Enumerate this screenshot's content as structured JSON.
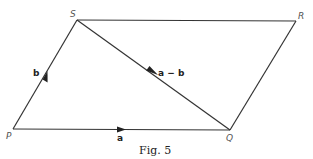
{
  "figure": {
    "caption": "Fig. 5",
    "vertices": {
      "P": {
        "label": "P",
        "x": 13,
        "y": 129
      },
      "Q": {
        "label": "Q",
        "x": 230,
        "y": 130
      },
      "R": {
        "label": "R",
        "x": 296,
        "y": 21
      },
      "S": {
        "label": "S",
        "x": 77,
        "y": 20
      }
    },
    "vectors": [
      {
        "name": "a",
        "label": "a",
        "from": "P",
        "to": "Q"
      },
      {
        "name": "b",
        "label": "b",
        "from": "P",
        "to": "S"
      },
      {
        "name": "a-b",
        "label": "a − b",
        "from": "S",
        "to": "Q"
      }
    ],
    "colors": {
      "line": "#333333",
      "text": "#222222"
    }
  }
}
